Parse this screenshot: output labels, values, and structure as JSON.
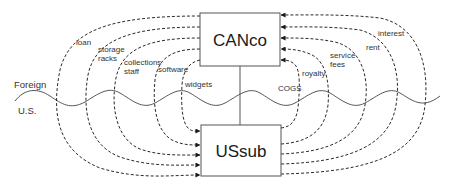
{
  "diagram": {
    "entities": {
      "parent": {
        "label": "CANco"
      },
      "subsidiary": {
        "label": "USsub"
      }
    },
    "border": {
      "upper_region": "Foreign",
      "lower_region": "U.S."
    },
    "flows_parent_to_sub": [
      {
        "label": "loan"
      },
      {
        "label": "storage",
        "label2": "racks"
      },
      {
        "label": "collections",
        "label2": "staff"
      },
      {
        "label": "software"
      },
      {
        "label": "widgets"
      }
    ],
    "flows_sub_to_parent": [
      {
        "label": "COGS"
      },
      {
        "label": "royalty"
      },
      {
        "label": "service",
        "label2": "fees"
      },
      {
        "label": "rent"
      },
      {
        "label": "interest"
      }
    ],
    "colors": {
      "line": "#2a2a2a",
      "box_border": "#555555",
      "background": "#ffffff"
    }
  }
}
